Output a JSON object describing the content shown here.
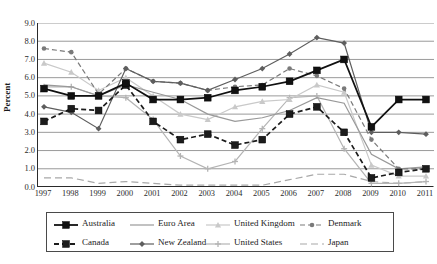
{
  "chart_data": {
    "type": "line",
    "title": "",
    "xlabel": "",
    "ylabel": "Percent",
    "ylim": [
      0.0,
      9.0
    ],
    "ytick_labels": [
      "9.0",
      "8.0",
      "7.0",
      "6.0",
      "5.0",
      "4.0",
      "3.0",
      "2.0",
      "1.0",
      "0.0"
    ],
    "grid": true,
    "grid_axis": "y",
    "legend_position": "bottom",
    "x": [
      1997,
      1998,
      1999,
      2000,
      2001,
      2002,
      2003,
      2004,
      2005,
      2006,
      2007,
      2008,
      2009,
      2010,
      2011
    ],
    "categories": [
      "1997",
      "1998",
      "1999",
      "2000",
      "2001",
      "2002",
      "2003",
      "2004",
      "2005",
      "2006",
      "2007",
      "2008",
      "2009",
      "2010",
      "2011"
    ],
    "series": [
      {
        "name": "Australia",
        "color": "#111111",
        "marker": "square-filled",
        "dash": "solid",
        "values": [
          5.4,
          5.0,
          5.0,
          5.7,
          4.8,
          4.8,
          4.9,
          5.3,
          5.5,
          5.8,
          6.4,
          7.0,
          3.3,
          4.8,
          4.8
        ]
      },
      {
        "name": "Euro Area",
        "color": "#999999",
        "marker": "none",
        "dash": "solid",
        "values": [
          5.6,
          5.5,
          5.0,
          5.6,
          5.2,
          4.8,
          4.0,
          3.6,
          3.8,
          4.2,
          4.9,
          4.6,
          1.8,
          1.0,
          1.1
        ]
      },
      {
        "name": "United Kingdom",
        "color": "#c9c9c9",
        "marker": "triangle",
        "dash": "solid",
        "values": [
          6.8,
          6.3,
          5.3,
          6.0,
          5.0,
          4.0,
          3.7,
          4.4,
          4.7,
          4.8,
          5.6,
          5.2,
          1.2,
          0.6,
          0.6
        ]
      },
      {
        "name": "Denmark",
        "color": "#7a7a7a",
        "marker": "circle",
        "dash": "dashed",
        "values": [
          7.6,
          7.4,
          5.1,
          6.5,
          5.8,
          5.7,
          5.3,
          5.5,
          5.6,
          6.5,
          6.1,
          5.4,
          2.6,
          1.0,
          1.0
        ]
      },
      {
        "name": "Canada",
        "color": "#1c1c1c",
        "marker": "square-filled",
        "dash": "dashed",
        "values": [
          3.6,
          4.3,
          4.2,
          5.6,
          3.6,
          2.6,
          2.9,
          2.3,
          2.6,
          4.0,
          4.4,
          3.0,
          0.5,
          0.8,
          1.0
        ]
      },
      {
        "name": "New Zealand",
        "color": "#5e5e5e",
        "marker": "diamond",
        "dash": "solid",
        "values": [
          4.4,
          4.1,
          3.2,
          6.5,
          5.8,
          5.7,
          5.3,
          5.9,
          6.5,
          7.3,
          8.2,
          7.9,
          3.0,
          3.0,
          2.9
        ]
      },
      {
        "name": "United States",
        "color": "#b4b4b4",
        "marker": "plus",
        "dash": "solid",
        "values": [
          5.5,
          5.5,
          5.0,
          4.9,
          3.7,
          1.7,
          1.0,
          1.4,
          3.2,
          4.9,
          5.0,
          2.1,
          0.2,
          0.2,
          0.3
        ]
      },
      {
        "name": "Japan",
        "color": "#a8a8a8",
        "marker": "none",
        "dash": "long-dash",
        "values": [
          0.5,
          0.5,
          0.2,
          0.3,
          0.2,
          0.1,
          0.1,
          0.1,
          0.1,
          0.4,
          0.7,
          0.7,
          0.3,
          0.2,
          0.3
        ]
      }
    ]
  },
  "legend": {
    "items": [
      {
        "label": "Australia",
        "series": 0
      },
      {
        "label": "Euro Area",
        "series": 1
      },
      {
        "label": "United Kingdom",
        "series": 2
      },
      {
        "label": "Denmark",
        "series": 3
      },
      {
        "label": "Canada",
        "series": 4
      },
      {
        "label": "New Zealand",
        "series": 5
      },
      {
        "label": "United States",
        "series": 6
      },
      {
        "label": "Japan",
        "series": 7
      }
    ]
  }
}
